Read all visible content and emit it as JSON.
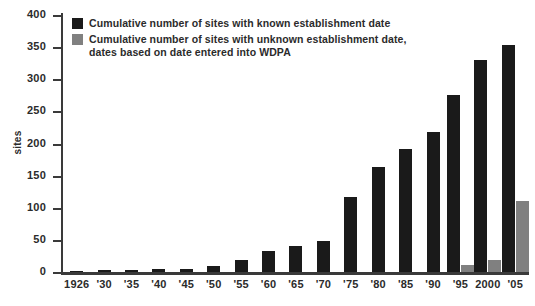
{
  "chart_data": {
    "type": "bar",
    "title": "",
    "xlabel": "",
    "ylabel": "sites",
    "ylim": [
      0,
      400
    ],
    "ytick_step": 50,
    "yticks": [
      400,
      350,
      300,
      250,
      200,
      150,
      100,
      50,
      0
    ],
    "grid": false,
    "legend_position": "top-left",
    "categories": [
      "1926",
      "'30",
      "'35",
      "'40",
      "'45",
      "'50",
      "'55",
      "'60",
      "'65",
      "'70",
      "'75",
      "'80",
      "'85",
      "'90",
      "'95",
      "2000",
      "'05"
    ],
    "series": [
      {
        "name": "Cumulative number of sites with known establishment date",
        "color": "#1a1a1a",
        "values": [
          2,
          3,
          3,
          4,
          5,
          9,
          18,
          32,
          41,
          49,
          116,
          163,
          191,
          218,
          275,
          330,
          353
        ]
      },
      {
        "name": "Cumulative number of sites with unknown establishment date,\ndates based on date entered into WDPA",
        "color": "#808080",
        "values": [
          0,
          0,
          0,
          0,
          0,
          0,
          0,
          0,
          0,
          0,
          0,
          0,
          0,
          0,
          11,
          19,
          111
        ]
      }
    ]
  },
  "legend": {
    "items": [
      {
        "label": "Cumulative number of sites with known establishment date",
        "color": "#1a1a1a"
      },
      {
        "label": "Cumulative number of sites with unknown establishment date,\ndates based on date entered into WDPA",
        "color": "#808080"
      }
    ]
  },
  "axes": {
    "y_title": "sites",
    "y_tick_labels": [
      "400",
      "350",
      "300",
      "250",
      "200",
      "150",
      "100",
      "50",
      "0"
    ],
    "x_tick_labels": [
      "1926",
      "'30",
      "'35",
      "'40",
      "'45",
      "'50",
      "'55",
      "'60",
      "'65",
      "'70",
      "'75",
      "'80",
      "'85",
      "'90",
      "'95",
      "2000",
      "'05"
    ]
  },
  "colors": {
    "known": "#1a1a1a",
    "unknown": "#808080",
    "axis": "#3a3a3a",
    "text": "#2b2b2b",
    "background": "#ffffff"
  }
}
